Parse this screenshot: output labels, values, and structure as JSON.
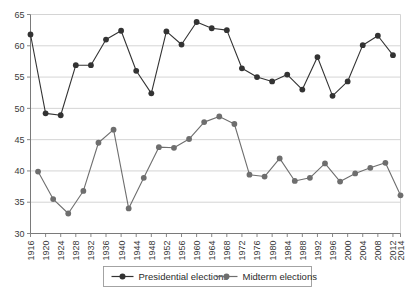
{
  "chart_data": {
    "type": "line",
    "title": "",
    "subtitle": "",
    "xlabel": "",
    "ylabel": "",
    "ylim": [
      30,
      65
    ],
    "ytick_step": 5,
    "yticks": [
      30,
      35,
      40,
      45,
      50,
      55,
      60,
      65
    ],
    "grid": "horizontal",
    "legend_position": "bottom-center",
    "xticks": [
      "1916",
      "1920",
      "1924",
      "1928",
      "1932",
      "1936",
      "1940",
      "1944",
      "1948",
      "1952",
      "1956",
      "1960",
      "1964",
      "1968",
      "1972",
      "1976",
      "1980",
      "1984",
      "1988",
      "1992",
      "1996",
      "2000",
      "2004",
      "2008",
      "2012",
      "2014"
    ],
    "colors": {
      "presidential": "#333333",
      "midterm": "#6e6e6e",
      "gridline": "#c9c9c9",
      "axis": "#7a7a7a",
      "background": "#ffffff"
    },
    "series": [
      {
        "name": "Presidential elections",
        "color": "#333333",
        "x": [
          1916,
          1920,
          1924,
          1928,
          1932,
          1936,
          1940,
          1944,
          1948,
          1952,
          1956,
          1960,
          1964,
          1968,
          1972,
          1976,
          1980,
          1984,
          1988,
          1992,
          1996,
          2000,
          2004,
          2008,
          2012
        ],
        "values": [
          61.8,
          49.2,
          48.9,
          56.9,
          56.9,
          61.0,
          62.4,
          56.0,
          52.4,
          62.3,
          60.2,
          63.8,
          62.8,
          62.5,
          56.4,
          55.0,
          54.3,
          55.4,
          53.0,
          58.2,
          52.0,
          54.3,
          60.1,
          61.6,
          58.5
        ]
      },
      {
        "name": "Midterm elections",
        "color": "#6e6e6e",
        "x": [
          1918,
          1922,
          1926,
          1930,
          1934,
          1938,
          1942,
          1946,
          1950,
          1954,
          1958,
          1962,
          1966,
          1970,
          1974,
          1978,
          1982,
          1986,
          1990,
          1994,
          1998,
          2002,
          2006,
          2010,
          2014
        ],
        "values": [
          39.9,
          35.5,
          33.2,
          36.8,
          44.5,
          46.6,
          34.0,
          38.9,
          43.8,
          43.7,
          45.1,
          47.8,
          48.7,
          47.5,
          39.4,
          39.1,
          42.0,
          38.4,
          38.9,
          41.2,
          38.3,
          39.6,
          40.5,
          41.3,
          36.1
        ]
      }
    ]
  },
  "legend": {
    "entries": [
      {
        "label": "Presidential elections"
      },
      {
        "label": "Midterm elections"
      }
    ]
  }
}
